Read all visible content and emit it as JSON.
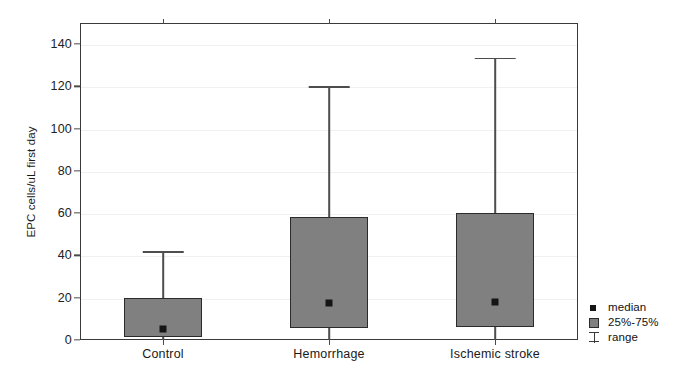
{
  "chart_data": {
    "type": "bar",
    "plot_style": "boxplot",
    "title": "",
    "xlabel": "",
    "ylabel": "EPC cells/uL  first day",
    "categories": [
      "Control",
      "Hemorrhage",
      "Ischemic stroke"
    ],
    "ylim": [
      0,
      150
    ],
    "yticks": [
      0,
      20,
      40,
      60,
      80,
      100,
      120,
      140
    ],
    "ytick_labels": [
      "0",
      "20",
      "40",
      "60",
      "80",
      "100",
      "120",
      "140"
    ],
    "grid": "horizontal",
    "legend_position": "right",
    "legend": [
      {
        "key": "median",
        "label": "median"
      },
      {
        "key": "iqr",
        "label": "25%-75%"
      },
      {
        "key": "range",
        "label": "range"
      }
    ],
    "series": [
      {
        "name": "Control",
        "median": 5,
        "q1": 1.5,
        "q3": 20,
        "min": 0,
        "max": 42
      },
      {
        "name": "Hemorrhage",
        "median": 17.5,
        "q1": 5.7,
        "q3": 58,
        "min": 0,
        "max": 120
      },
      {
        "name": "Ischemic stroke",
        "median": 18,
        "q1": 6,
        "q3": 60,
        "min": 0,
        "max": 133.5
      }
    ],
    "colors": {
      "box_fill": "#808080",
      "box_border": "#2b2b2b",
      "whisker": "#4d4d4d",
      "median": "#151515",
      "grid": "#f0f0f0",
      "axis": "#3a3a3a",
      "background": "#ffffff"
    }
  }
}
